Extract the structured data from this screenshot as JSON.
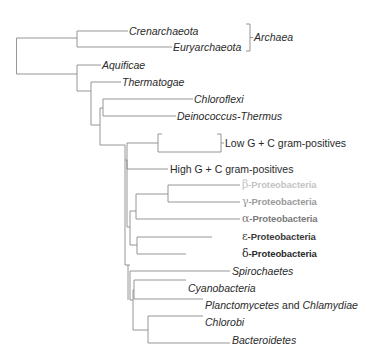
{
  "diagram": {
    "type": "phylogenetic-tree",
    "line_color": "#8a8a8a",
    "taxa": {
      "crenarchaeota": "Crenarchaeota",
      "euryarchaeota": "Euryarchaeota",
      "aquificae": "Aquificae",
      "thermatogae": "Thermatogae",
      "chloroflexi": "Chloroflexi",
      "deinococcus": "Deinococcus-Thermus",
      "low_gc": "Low G + C gram-positives",
      "high_gc": "High G + C gram-positives",
      "spirochaetes": "Spirochaetes",
      "cyanobacteria": "Cyanobacteria",
      "planctomycetes": "Planctomycetes",
      "and": " and ",
      "chlamydiae": "Chlamydiae",
      "chlorobi": "Chlorobi",
      "bacteroidetes": "Bacteroidetes"
    },
    "groups": {
      "archaea": "Archaea"
    },
    "proteobacteria": [
      {
        "greek": "β",
        "suffix": "-Proteobacteria",
        "color": "#c4c4c4"
      },
      {
        "greek": "γ",
        "suffix": "-Proteobacteria",
        "color": "#9a9a9a"
      },
      {
        "greek": "α",
        "suffix": "-Proteobacteria",
        "color": "#7a7a7a"
      },
      {
        "greek": "ε",
        "suffix": "-Proteobacteria",
        "color": "#3a3a3a"
      },
      {
        "greek": "δ",
        "suffix": "-Proteobacteria",
        "color": "#2a2a2a"
      }
    ]
  }
}
